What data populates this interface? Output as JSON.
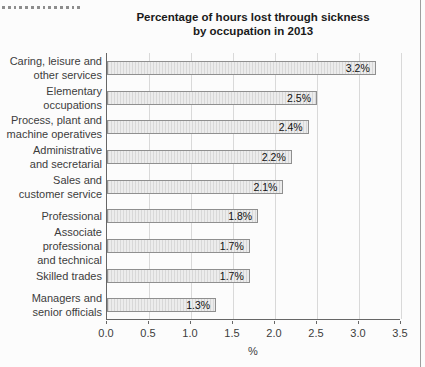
{
  "chart_data": {
    "type": "bar",
    "orientation": "horizontal",
    "title_line1": "Percentage of hours lost through sickness",
    "title_line2": "by occupation in 2013",
    "categories": [
      "Caring, leisure and other services",
      "Elementary occupations",
      "Process, plant and machine operatives",
      "Administrative and secretarial",
      "Sales and customer service",
      "Professional",
      "Associate professional and technical",
      "Skilled trades",
      "Managers and senior officials"
    ],
    "label_lines": [
      [
        "Caring, leisure and",
        "other services"
      ],
      [
        "Elementary",
        "occupations"
      ],
      [
        "Process, plant and",
        "machine operatives"
      ],
      [
        "Administrative",
        "and secretarial"
      ],
      [
        "Sales and",
        "customer service"
      ],
      [
        "Professional"
      ],
      [
        "Associate professional",
        "and technical"
      ],
      [
        "Skilled trades"
      ],
      [
        "Managers and",
        "senior officials"
      ]
    ],
    "values": [
      3.2,
      2.5,
      2.4,
      2.2,
      2.1,
      1.8,
      1.7,
      1.7,
      1.3
    ],
    "value_labels": [
      "3.2%",
      "2.5%",
      "2.4%",
      "2.2%",
      "2.1%",
      "1.8%",
      "1.7%",
      "1.7%",
      "1.3%"
    ],
    "xlabel": "%",
    "xlim": [
      0,
      3.5
    ],
    "xtick_labels": [
      "0.0",
      "0.5",
      "1.0",
      "1.5",
      "2.0",
      "2.5",
      "3.0",
      "3.5"
    ],
    "grid": "vertical gridlines every 0.5, behind bars",
    "legend": "none",
    "colors": {
      "background": "#fcfcfc",
      "bar_fill": "#ececec",
      "bar_stripe": "#d8d8d8",
      "bar_border": "#8f8f8f",
      "gridline": "#d9d9d9",
      "axis": "#666666",
      "title_text": "#1a1a1a",
      "label_text": "#3c3c3c",
      "page_edge": "#9e9e9e",
      "dotted_divider": "#8d8d8d"
    }
  }
}
